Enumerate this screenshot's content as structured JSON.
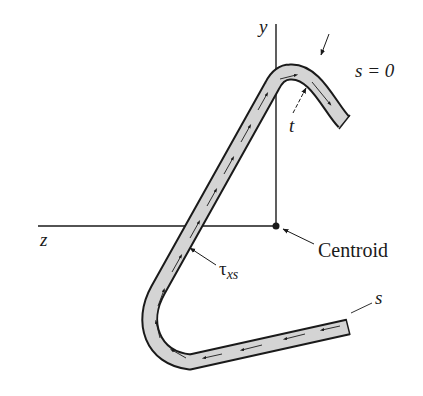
{
  "diagram": {
    "type": "thin-walled open section shear flow",
    "axes": {
      "y_label": "y",
      "z_label": "z"
    },
    "labels": {
      "s_start": "s = 0",
      "thickness": "t",
      "shear_stress_symbol": "τ",
      "shear_stress_subscript": "xs",
      "centroid": "Centroid",
      "s_coordinate": "s"
    },
    "colors": {
      "strip_fill": "#d4d4d4",
      "line": "#1a1a1a",
      "background": "#ffffff"
    }
  }
}
